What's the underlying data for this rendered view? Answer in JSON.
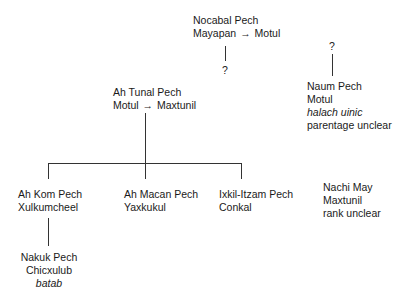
{
  "diagram": {
    "type": "genealogy-tree",
    "nodes": [
      {
        "id": "nocabal",
        "name": "Nocabal Pech",
        "place_from": "Mayapan",
        "arrow": "→",
        "place_to": "Motul"
      },
      {
        "id": "naum",
        "name": "Naum Pech",
        "place": "Motul",
        "title": "halach uinic",
        "note": "parentage unclear"
      },
      {
        "id": "ah_tunal",
        "name": "Ah Tunal Pech",
        "place_from": "Motul",
        "arrow": "→",
        "place_to": "Maxtunil"
      },
      {
        "id": "ah_kom",
        "name": "Ah Kom Pech",
        "place": "Xulkumcheel"
      },
      {
        "id": "ah_macan",
        "name": "Ah Macan Pech",
        "place": "Yaxkukul"
      },
      {
        "id": "ixkil",
        "name": "Ixkil-Itzam Pech",
        "place": "Conkal"
      },
      {
        "id": "nachi",
        "name": "Nachi May",
        "place": "Maxtunil",
        "note": "rank unclear"
      },
      {
        "id": "nakuk",
        "name": "Nakuk Pech",
        "place": "Chicxulub",
        "title": "batab"
      }
    ],
    "uncertain_marks": [
      "?",
      "?"
    ]
  }
}
